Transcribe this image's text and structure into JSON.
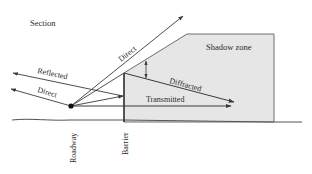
{
  "diagram": {
    "title": "Section",
    "labels": {
      "shadow_zone": "Shadow zone",
      "direct_up": "Direct",
      "reflected": "Reflected",
      "direct_left": "Direct",
      "diffracted": "Diffracted",
      "transmitted": "Transmitted",
      "roadway": "Roadway",
      "barrier": "Barrier"
    },
    "colors": {
      "line": "#3a3a3a",
      "shadow_fill": "#e6e6e6",
      "shadow_edge": "#6e6e6e",
      "ground": "#555555"
    }
  }
}
